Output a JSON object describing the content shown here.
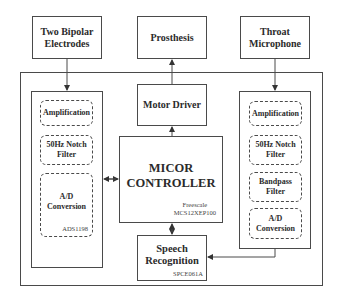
{
  "diagram": {
    "inputs": {
      "electrodes": "Two Bipolar Electrodes",
      "prosthesis": "Prosthesis",
      "microphone": "Throat Microphone"
    },
    "left_panel": {
      "blocks": [
        "Amplification",
        "50Hz Notch Filter",
        "A/D Conversion"
      ],
      "chip": "ADS1198"
    },
    "right_panel": {
      "blocks": [
        "Amplification",
        "50Hz Notch Filter",
        "Bandpass Filter",
        "A/D Conversion"
      ]
    },
    "motor_driver": "Motor Driver",
    "controller": {
      "title_line1": "MICOR",
      "title_line2": "CONTROLLER",
      "chip_line1": "Freescale",
      "chip_line2": "MCS12XEP100"
    },
    "speech": {
      "title_line1": "Speech",
      "title_line2": "Recognition",
      "chip": "SPCE061A"
    },
    "colors": {
      "line": "#4a4a4a",
      "background": "#ffffff"
    }
  }
}
